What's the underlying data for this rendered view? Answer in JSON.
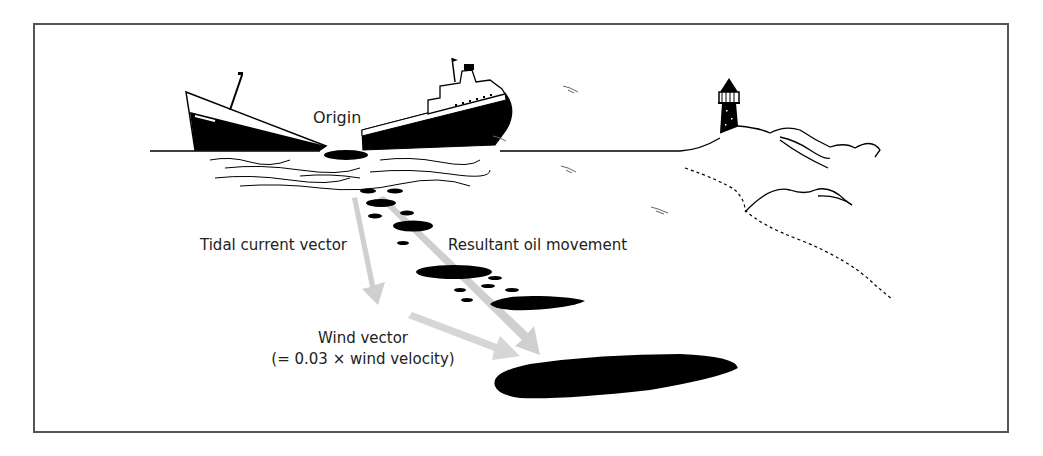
{
  "diagram": {
    "type": "oil-spill-trajectory",
    "labels": {
      "origin": "Origin",
      "tidal": "Tidal current vector",
      "resultant": "Resultant oil movement",
      "wind_line1": "Wind vector",
      "wind_line2": "(= 0.03 × wind velocity)"
    },
    "elements": [
      "broken-ship",
      "oil-slick-origin",
      "oil-patches",
      "tidal-current-arrow",
      "wind-arrow",
      "resultant-arrow",
      "lighthouse",
      "coastline",
      "hills",
      "seabirds"
    ],
    "colors": {
      "ink": "#000000",
      "arrow": "#cccccc",
      "frame": "#555555",
      "text": "#222222"
    }
  }
}
